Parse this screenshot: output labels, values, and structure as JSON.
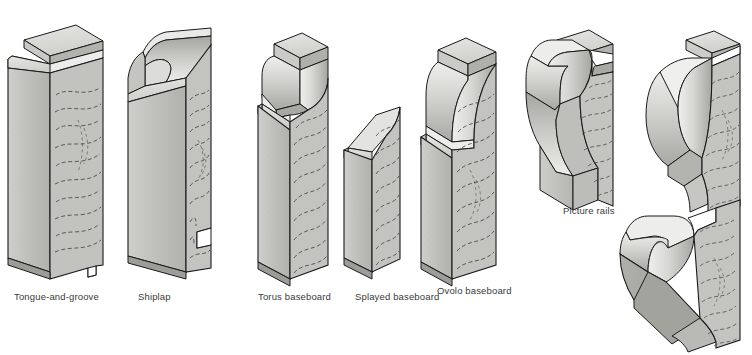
{
  "figure": {
    "background_color": "#ffffff",
    "palette": {
      "wood_face_light": "#d9d9d6",
      "wood_face_mid": "#bfbfbb",
      "wood_face_dark": "#a9a9a4",
      "wood_face_darker": "#989893",
      "end_grain": "#c6c6c2",
      "outline": "#1a1a1a",
      "grain_line": "#3d3d3d",
      "label_text": "#3a3a3a"
    }
  },
  "items": [
    {
      "id": "tongue-and-groove",
      "label": "Tongue-and-groove",
      "label_x": 14,
      "label_y": 291,
      "kind": "board",
      "description": "Isometric board with tongue ridge on top edge and groove notch at bottom edge"
    },
    {
      "id": "shiplap",
      "label": "Shiplap",
      "label_x": 138,
      "label_y": 291,
      "kind": "board",
      "description": "Isometric board with concave cove rebate along top edge and step rabbet at bottom"
    },
    {
      "id": "torus-baseboard",
      "label": "Torus baseboard",
      "label_x": 258,
      "label_y": 291,
      "kind": "baseboard",
      "description": "Baseboard with half-round torus bead below a square top fillet"
    },
    {
      "id": "splayed-baseboard",
      "label": "Splayed baseboard",
      "label_x": 355,
      "label_y": 291,
      "kind": "baseboard",
      "description": "Baseboard with plain angled splay chamfer across the top"
    },
    {
      "id": "ovolo-baseboard",
      "label": "Ovolo baseboard",
      "label_x": 437,
      "label_y": 285,
      "kind": "baseboard",
      "description": "Baseboard with convex ovolo quarter-round curve under a square top fillet"
    },
    {
      "id": "picture-rail-1",
      "label": "Picture rails",
      "label_x": 563,
      "label_y": 205,
      "kind": "picture-rail",
      "description": "Picture rail with rounded top hook, deep hollow cove and bottom fillet"
    },
    {
      "id": "picture-rail-2",
      "label": "",
      "label_x": 0,
      "label_y": 0,
      "kind": "picture-rail",
      "description": "Picture rail with large bullnose roll top and small cove at the bottom"
    },
    {
      "id": "picture-rail-3",
      "label": "",
      "label_x": 0,
      "label_y": 0,
      "kind": "picture-rail",
      "description": "Picture rail with angled undercut hook forming a deep V shelf"
    }
  ]
}
